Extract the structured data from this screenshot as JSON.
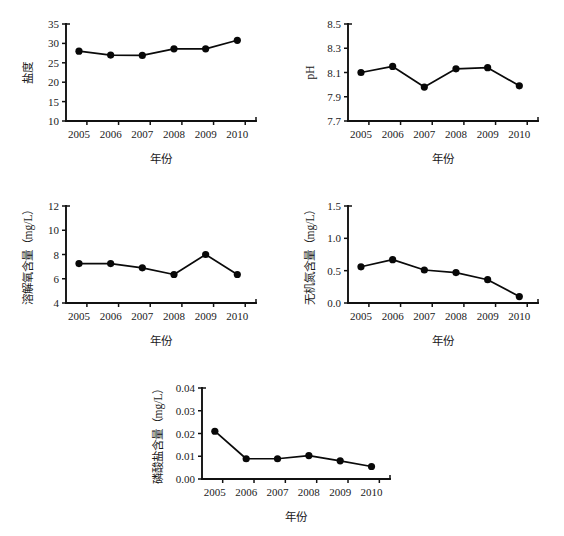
{
  "figure": {
    "background_color": "#ffffff",
    "line_color": "#0a0a0a",
    "marker_color": "#080808",
    "axis_color": "#111111",
    "panel_count": 5
  },
  "common": {
    "xlabel": "年份",
    "categories": [
      "2005",
      "2006",
      "2007",
      "2008",
      "2009",
      "2010"
    ]
  },
  "chart_data": [
    {
      "id": "salinity",
      "type": "line",
      "title": "",
      "xlabel": "年份",
      "ylabel": "盐度",
      "categories": [
        "2005",
        "2006",
        "2007",
        "2008",
        "2009",
        "2010"
      ],
      "values": [
        28.0,
        27.0,
        26.9,
        28.6,
        28.6,
        30.8
      ],
      "ylim": [
        10,
        35
      ],
      "yticks": [
        10,
        15,
        20,
        25,
        30,
        35
      ],
      "ytick_labels": [
        "10",
        "15",
        "20",
        "25",
        "30",
        "35"
      ],
      "grid": false,
      "legend": "none"
    },
    {
      "id": "ph",
      "type": "line",
      "title": "",
      "xlabel": "年份",
      "ylabel": "pH",
      "categories": [
        "2005",
        "2006",
        "2007",
        "2008",
        "2009",
        "2010"
      ],
      "values": [
        8.1,
        8.15,
        7.98,
        8.13,
        8.14,
        7.99
      ],
      "ylim": [
        7.7,
        8.5
      ],
      "yticks": [
        7.7,
        7.9,
        8.1,
        8.3,
        8.5
      ],
      "ytick_labels": [
        "7.7",
        "7.9",
        "8.1",
        "8.3",
        "8.5"
      ],
      "grid": false,
      "legend": "none"
    },
    {
      "id": "dissolved-oxygen",
      "type": "line",
      "title": "",
      "xlabel": "年份",
      "ylabel": "溶解氧含量（mg/L）",
      "categories": [
        "2005",
        "2006",
        "2007",
        "2008",
        "2009",
        "2010"
      ],
      "values": [
        7.25,
        7.25,
        6.9,
        6.35,
        8.0,
        6.35
      ],
      "ylim": [
        4,
        12
      ],
      "yticks": [
        4,
        6,
        8,
        10,
        12
      ],
      "ytick_labels": [
        "4",
        "6",
        "8",
        "10",
        "12"
      ],
      "grid": false,
      "legend": "none"
    },
    {
      "id": "inorganic-nitrogen",
      "type": "line",
      "title": "",
      "xlabel": "年份",
      "ylabel": "无机氮含量（mg/L）",
      "categories": [
        "2005",
        "2006",
        "2007",
        "2008",
        "2009",
        "2010"
      ],
      "values": [
        0.56,
        0.67,
        0.51,
        0.47,
        0.36,
        0.1
      ],
      "ylim": [
        0.0,
        1.5
      ],
      "yticks": [
        0.0,
        0.5,
        1.0,
        1.5
      ],
      "ytick_labels": [
        "0.0",
        "0.5",
        "1.0",
        "1.5"
      ],
      "grid": false,
      "legend": "none"
    },
    {
      "id": "phosphate",
      "type": "line",
      "title": "",
      "xlabel": "年份",
      "ylabel": "磷酸盐含量（mg/L）",
      "categories": [
        "2005",
        "2006",
        "2007",
        "2008",
        "2009",
        "2010"
      ],
      "values": [
        0.021,
        0.0089,
        0.0089,
        0.0103,
        0.008,
        0.0055
      ],
      "ylim": [
        0.0,
        0.04
      ],
      "yticks": [
        0.0,
        0.01,
        0.02,
        0.03,
        0.04
      ],
      "ytick_labels": [
        "0.00",
        "0.01",
        "0.02",
        "0.03",
        "0.04"
      ],
      "grid": false,
      "legend": "none"
    }
  ]
}
